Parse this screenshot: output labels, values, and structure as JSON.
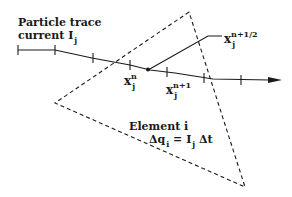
{
  "diagram": {
    "title_line1": "Particle trace",
    "title_line2_prefix": "current I",
    "title_line2_sub": "j",
    "labels": {
      "xn": {
        "base": "x",
        "sub": "j",
        "sup": "n"
      },
      "xn1": {
        "base": "x",
        "sub": "j",
        "sup": "n+1"
      },
      "xhalf": {
        "base": "x",
        "sub": "j",
        "sup": "n+1/2"
      }
    },
    "element": {
      "name": "Element i",
      "eq_lhs": "Δq",
      "eq_lhs_sub": "i",
      "eq_eq": " =",
      "eq_rhs_I": "I",
      "eq_rhs_sub": "j",
      "eq_rhs_dt": "Δt"
    },
    "colors": {
      "ink": "#1a1a1a",
      "background": "#ffffff"
    },
    "shapes": {
      "triangle": [
        [
          189,
          12
        ],
        [
          55,
          103
        ],
        [
          245,
          187
        ]
      ],
      "trace_points": [
        [
          18,
          50
        ],
        [
          55,
          50
        ],
        [
          92,
          58
        ],
        [
          130,
          65
        ],
        [
          175,
          73
        ],
        [
          213,
          79
        ],
        [
          278,
          80
        ]
      ],
      "tick_x": [
        18,
        55,
        92,
        130,
        158,
        188,
        213,
        250
      ]
    }
  }
}
